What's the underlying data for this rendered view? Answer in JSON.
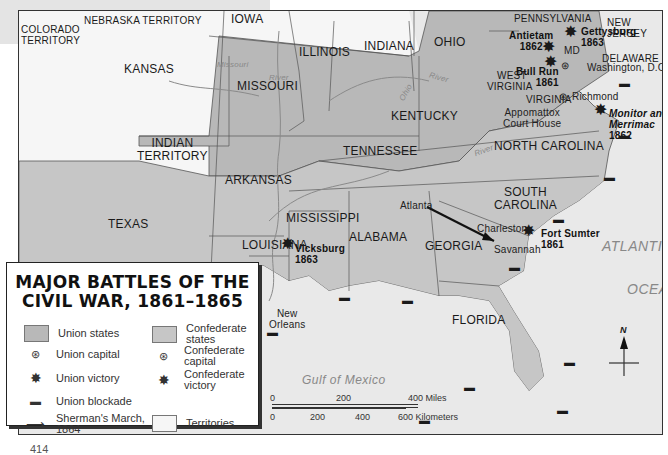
{
  "title_lines": [
    "MAJOR BATTLES OF THE",
    "CIVIL WAR, 1861–1865"
  ],
  "colors": {
    "union": "#b8b8b8",
    "confederate": "#c6c6c6",
    "territory": "#f6f6f6",
    "water": "#e9e9e9",
    "border": "#444444",
    "river": "#8a8a8a"
  },
  "legend": [
    {
      "icon": "union-states-swatch",
      "label": "Union states"
    },
    {
      "icon": "confederate-states-swatch",
      "label": "Confederate states"
    },
    {
      "icon": "union-capital-icon",
      "label": "Union capital"
    },
    {
      "icon": "confederate-capital-icon",
      "label": "Confederate capital"
    },
    {
      "icon": "union-victory-icon",
      "label": "Union victory"
    },
    {
      "icon": "confederate-victory-icon",
      "label": "Confederate victory"
    },
    {
      "icon": "union-blockade-icon",
      "label": "Union blockade"
    },
    {
      "icon": "shermans-march-arrow-icon",
      "label": "Sherman's March, 1864"
    },
    {
      "icon": "territories-swatch",
      "label": "Territories"
    }
  ],
  "legend_labels": {
    "union_states": "Union states",
    "confederate_states_1": "Confederate",
    "confederate_states_2": "states",
    "union_capital": "Union capital",
    "confederate_capital_1": "Confederate",
    "confederate_capital_2": "capital",
    "union_victory": "Union victory",
    "confederate_victory_1": "Confederate",
    "confederate_victory_2": "victory",
    "union_blockade": "Union blockade",
    "shermans_march_1": "Sherman's March,",
    "shermans_march_2": "1864",
    "territories": "Territories"
  },
  "regions": {
    "colorado_1": "COLORADO",
    "colorado_2": "TERRITORY",
    "nebraska": "NEBRASKA TERRITORY",
    "iowa": "IOWA",
    "kansas": "KANSAS",
    "missouri": "MISSOURI",
    "illinois": "ILLINOIS",
    "indiana": "INDIANA",
    "ohio": "OHIO",
    "pennsylvania": "PENNSYLVANIA",
    "new_jersey_1": "NEW",
    "new_jersey_2": "JERSEY",
    "md": "MD",
    "delaware": "DELAWARE",
    "west_virginia_1": "WEST",
    "west_virginia_2": "VIRGINIA",
    "virginia": "VIRGINIA",
    "kentucky": "KENTUCKY",
    "indian_territory_1": "INDIAN",
    "indian_territory_2": "TERRITORY",
    "arkansas": "ARKANSAS",
    "tennessee": "TENNESSEE",
    "north_carolina": "NORTH CAROLINA",
    "south_carolina_1": "SOUTH",
    "south_carolina_2": "CAROLINA",
    "texas": "TEXAS",
    "mississippi": "MISSISSIPPI",
    "alabama": "ALABAMA",
    "georgia": "GEORGIA",
    "louisiana": "LOUISIANA",
    "florida": "FLORIDA"
  },
  "cities": {
    "washington": "Washington, D.C.",
    "richmond": "Richmond",
    "appomattox_1": "Appomattox",
    "appomattox_2": "Court House",
    "atlanta": "Atlanta",
    "charleston": "Charleston",
    "savannah": "Savannah",
    "new_orleans_1": "New",
    "new_orleans_2": "Orleans"
  },
  "battles": [
    {
      "name": "Antietam",
      "year": "1862",
      "result": "union-victory"
    },
    {
      "name": "Gettysburg",
      "year": "1863",
      "result": "union-victory"
    },
    {
      "name": "Bull Run",
      "year": "1861",
      "result": "confederate-victory"
    },
    {
      "name": "Monitor and Merrimac",
      "year": "1862",
      "result": "confederate-victory"
    },
    {
      "name": "Fort Sumter",
      "year": "1861",
      "result": "confederate-victory"
    },
    {
      "name": "Vicksburg",
      "year": "1863",
      "result": "union-victory"
    }
  ],
  "battle_labels": {
    "antietam_1": "Antietam",
    "antietam_2": "1862",
    "gettysburg_1": "Gettysburg",
    "gettysburg_2": "1863",
    "bullrun_1": "Bull Run",
    "bullrun_2": "1861",
    "monitor_1": "Monitor and",
    "monitor_2": "Merrimac",
    "monitor_3": "1862",
    "sumter_1": "Fort Sumter",
    "sumter_2": "1861",
    "vicksburg_1": "Vicksburg",
    "vicksburg_2": "1863"
  },
  "water": {
    "gulf": "Gulf of Mexico",
    "atlantic": "ATLANTIC",
    "ocean": "OCEAN"
  },
  "rivers": {
    "missouri": "Missouri",
    "missouri_river": "River",
    "ohio": "Ohio",
    "ohio_river": "River",
    "mississippi": "Mississippi",
    "tennessee": "Tennessee",
    "tennessee_river": "River"
  },
  "scale": {
    "miles_ticks": [
      "0",
      "200",
      "400 Miles"
    ],
    "km_ticks": [
      "0",
      "200",
      "400",
      "600 Kilometers"
    ]
  },
  "compass": {
    "north_label": "N"
  },
  "page_number": "414"
}
